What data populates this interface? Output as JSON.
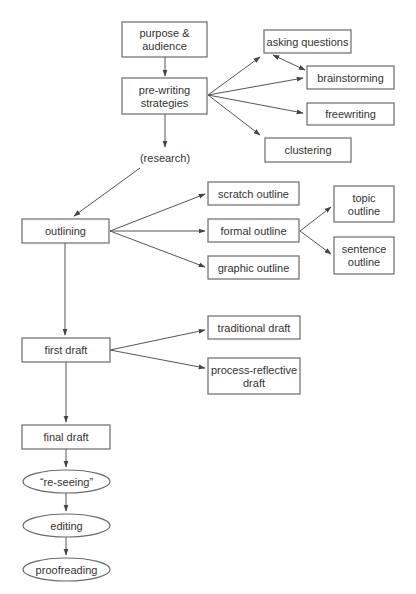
{
  "nodes": {
    "purpose": {
      "lines": [
        "purpose &",
        "audience"
      ],
      "shape": "rect"
    },
    "prewriting": {
      "lines": [
        "pre-writing",
        "strategies"
      ],
      "shape": "rect"
    },
    "asking": {
      "lines": [
        "asking questions"
      ],
      "shape": "rect"
    },
    "brainstorming": {
      "lines": [
        "brainstorming"
      ],
      "shape": "rect"
    },
    "freewriting": {
      "lines": [
        "freewriting"
      ],
      "shape": "rect"
    },
    "clustering": {
      "lines": [
        "clustering"
      ],
      "shape": "rect"
    },
    "research": {
      "lines": [
        "(research)"
      ],
      "shape": "text"
    },
    "outlining": {
      "lines": [
        "outlining"
      ],
      "shape": "rect"
    },
    "scratch": {
      "lines": [
        "scratch outline"
      ],
      "shape": "rect"
    },
    "formal": {
      "lines": [
        "formal outline"
      ],
      "shape": "rect"
    },
    "graphic": {
      "lines": [
        "graphic outline"
      ],
      "shape": "rect"
    },
    "topic": {
      "lines": [
        "topic",
        "outline"
      ],
      "shape": "rect"
    },
    "sentence": {
      "lines": [
        "sentence",
        "outline"
      ],
      "shape": "rect"
    },
    "firstdraft": {
      "lines": [
        "first draft"
      ],
      "shape": "rect"
    },
    "traditional": {
      "lines": [
        "traditional draft"
      ],
      "shape": "rect"
    },
    "processreflective": {
      "lines": [
        "process-reflective",
        "draft"
      ],
      "shape": "rect"
    },
    "finaldraft": {
      "lines": [
        "final draft"
      ],
      "shape": "rect"
    },
    "reseeing": {
      "lines": [
        "“re-seeing”"
      ],
      "shape": "ellipse"
    },
    "editing": {
      "lines": [
        "editing"
      ],
      "shape": "ellipse"
    },
    "proofreading": {
      "lines": [
        "proofreading"
      ],
      "shape": "ellipse"
    }
  },
  "edges": [
    {
      "from": "purpose",
      "to": "prewriting"
    },
    {
      "from": "prewriting",
      "to": "asking"
    },
    {
      "from": "prewriting",
      "to": "brainstorming"
    },
    {
      "from": "prewriting",
      "to": "freewriting"
    },
    {
      "from": "prewriting",
      "to": "clustering"
    },
    {
      "from": "asking",
      "to": "brainstorming",
      "bidirectional": true
    },
    {
      "from": "prewriting",
      "to": "research"
    },
    {
      "from": "research",
      "to": "outlining"
    },
    {
      "from": "outlining",
      "to": "scratch"
    },
    {
      "from": "outlining",
      "to": "formal"
    },
    {
      "from": "outlining",
      "to": "graphic"
    },
    {
      "from": "formal",
      "to": "topic"
    },
    {
      "from": "formal",
      "to": "sentence"
    },
    {
      "from": "outlining",
      "to": "firstdraft"
    },
    {
      "from": "firstdraft",
      "to": "traditional"
    },
    {
      "from": "firstdraft",
      "to": "processreflective"
    },
    {
      "from": "firstdraft",
      "to": "finaldraft"
    },
    {
      "from": "finaldraft",
      "to": "reseeing"
    },
    {
      "from": "reseeing",
      "to": "editing"
    },
    {
      "from": "editing",
      "to": "proofreading"
    }
  ]
}
